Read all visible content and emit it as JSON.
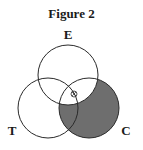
{
  "figure": {
    "title": "Figure 2",
    "sets": [
      {
        "id": "E",
        "label": "E",
        "cx": 68,
        "cy": 75,
        "r": 30,
        "label_x": 68,
        "label_y": 39
      },
      {
        "id": "T",
        "label": "T",
        "cx": 48,
        "cy": 108,
        "r": 30,
        "label_x": 12,
        "label_y": 135
      },
      {
        "id": "C",
        "label": "C",
        "cx": 89,
        "cy": 108,
        "r": 30,
        "label_x": 126,
        "label_y": 135
      }
    ],
    "shaded_region": "C minus E",
    "shade_color": "#6e6e6e",
    "line_color": "#2a2a2a",
    "marker": {
      "type": "circled-x",
      "cx": 74,
      "cy": 94,
      "r": 3
    }
  }
}
